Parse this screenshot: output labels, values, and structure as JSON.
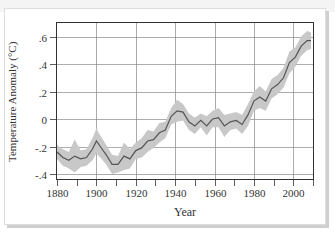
{
  "chart_data": {
    "type": "line",
    "title": "",
    "xlabel": "Year",
    "ylabel": "Temperature Anomaly (°C)",
    "xlim": [
      1880,
      2010
    ],
    "ylim": [
      -0.44,
      0.7
    ],
    "grid": true,
    "legend": "none",
    "x_ticks": [
      1880,
      1900,
      1920,
      1940,
      1960,
      1980,
      2000
    ],
    "x_tick_labels": [
      "1880",
      "1900",
      "1920",
      "1940",
      "1960",
      "1980",
      "2000"
    ],
    "y_ticks": [
      -0.4,
      -0.2,
      0,
      0.2,
      0.4,
      0.6
    ],
    "y_tick_labels": [
      "-.4",
      "-.2",
      "0",
      ".2",
      ".4",
      ".6"
    ],
    "series": [
      {
        "name": "Temperature anomaly (smoothed)",
        "color": "#555555",
        "band_color": "#c8c8c8",
        "x": [
          1880,
          1883,
          1886,
          1889,
          1892,
          1895,
          1898,
          1900,
          1902,
          1905,
          1908,
          1911,
          1914,
          1917,
          1920,
          1923,
          1926,
          1929,
          1932,
          1935,
          1938,
          1941,
          1944,
          1947,
          1950,
          1953,
          1956,
          1959,
          1962,
          1965,
          1968,
          1971,
          1974,
          1977,
          1980,
          1983,
          1986,
          1989,
          1992,
          1995,
          1998,
          2001,
          2004,
          2007,
          2009
        ],
        "values": [
          -0.24,
          -0.28,
          -0.3,
          -0.27,
          -0.29,
          -0.28,
          -0.22,
          -0.16,
          -0.2,
          -0.26,
          -0.33,
          -0.33,
          -0.27,
          -0.29,
          -0.23,
          -0.21,
          -0.16,
          -0.15,
          -0.1,
          -0.08,
          0.02,
          0.06,
          0.05,
          -0.02,
          -0.05,
          -0.01,
          -0.05,
          0.0,
          0.01,
          -0.05,
          -0.02,
          -0.01,
          -0.04,
          0.03,
          0.13,
          0.16,
          0.13,
          0.22,
          0.25,
          0.3,
          0.41,
          0.45,
          0.53,
          0.57,
          0.57
        ],
        "band_half_width": [
          0.05,
          0.06,
          0.06,
          0.12,
          0.06,
          0.06,
          0.08,
          0.09,
          0.08,
          0.07,
          0.07,
          0.06,
          0.1,
          0.07,
          0.06,
          0.07,
          0.08,
          0.06,
          0.07,
          0.06,
          0.06,
          0.08,
          0.06,
          0.06,
          0.06,
          0.05,
          0.07,
          0.06,
          0.07,
          0.08,
          0.06,
          0.06,
          0.07,
          0.08,
          0.07,
          0.08,
          0.07,
          0.07,
          0.07,
          0.07,
          0.08,
          0.07,
          0.07,
          0.07,
          0.06
        ]
      }
    ]
  }
}
